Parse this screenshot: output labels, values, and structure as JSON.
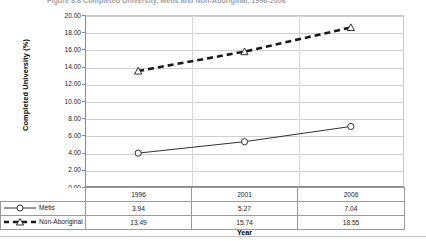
{
  "chart_title": "Figure 8.6  Completed University, Métis and Non-Aboriginal, 1996-2006",
  "chart_data": {
    "type": "line",
    "title": "Figure 8.6  Completed University, Métis and Non-Aboriginal, 1996-2006",
    "xlabel": "Year",
    "ylabel": "Completed University (%)",
    "categories": [
      "1996",
      "2001",
      "2006"
    ],
    "ylim": [
      0,
      20
    ],
    "ytick_step": 2,
    "ytick_labels": [
      "0.00",
      "2.00",
      "4.00",
      "6.00",
      "8.00",
      "10.00",
      "12.00",
      "14.00",
      "16.00",
      "18.00",
      "20.00"
    ],
    "grid": "horizontal-and-vertical",
    "legend_position": "data-table-left",
    "has_data_table": true,
    "series": [
      {
        "name": "Métis",
        "values": [
          3.94,
          5.27,
          7.04
        ],
        "marker": "circle-hollow",
        "line_style": "solid",
        "color": "#1a1a1a"
      },
      {
        "name": "Non-Aboriginal",
        "values": [
          13.49,
          15.74,
          18.55
        ],
        "marker": "triangle-hollow",
        "line_style": "dashed-thick",
        "color": "#1a1a1a"
      }
    ]
  },
  "table": {
    "header_row": [
      "",
      "1996",
      "2001",
      "2006"
    ],
    "rows": [
      {
        "label": "Métis",
        "cells": [
          "3.94",
          "5.27",
          "7.04"
        ]
      },
      {
        "label": "Non-Aboriginal",
        "cells": [
          "13.49",
          "15.74",
          "18.55"
        ]
      }
    ]
  },
  "colors": {
    "gridline": "#d0d0d0",
    "axis": "#8a8a8a",
    "series_line": "#1a1a1a",
    "table_border": "#9a9a9a",
    "background": "#ffffff"
  }
}
